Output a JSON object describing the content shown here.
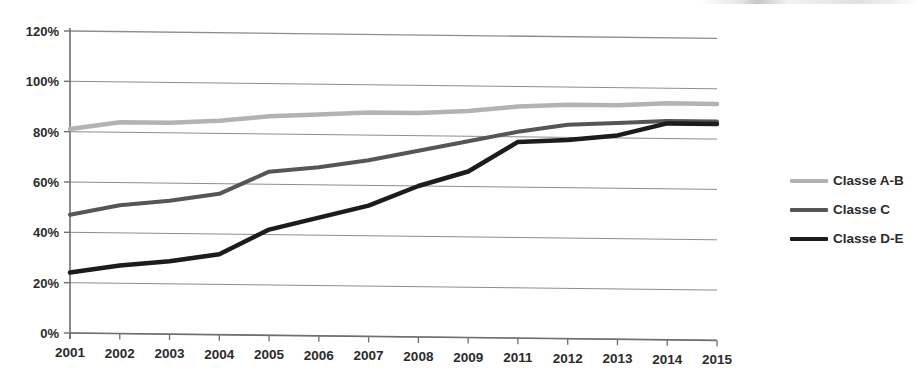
{
  "chart_data": {
    "type": "line",
    "title": "",
    "subtitle": "",
    "xlabel": "",
    "ylabel": "",
    "categories": [
      "2001",
      "2002",
      "2003",
      "2004",
      "2005",
      "2006",
      "2007",
      "2008",
      "2009",
      "2011",
      "2012",
      "2013",
      "2014",
      "2015"
    ],
    "ylim": [
      0,
      120
    ],
    "ytick_labels": [
      "0%",
      "20%",
      "40%",
      "60%",
      "80%",
      "100%",
      "120%"
    ],
    "ytick_values": [
      0,
      20,
      40,
      60,
      80,
      100,
      120
    ],
    "grid": true,
    "legend_position": "right",
    "series": [
      {
        "name": "Classe A-B",
        "color": "#b3b3b3",
        "width": 4.5,
        "values": [
          81,
          84,
          84,
          85,
          87,
          88,
          89,
          89,
          90,
          92,
          93,
          93,
          94,
          94
        ]
      },
      {
        "name": "Classe C",
        "color": "#565656",
        "width": 4.0,
        "values": [
          47,
          51,
          53,
          56,
          65,
          67,
          70,
          74,
          78,
          82,
          85,
          86,
          87,
          87
        ]
      },
      {
        "name": "Classe D-E",
        "color": "#1c1c1c",
        "width": 4.5,
        "values": [
          24,
          27,
          29,
          32,
          42,
          47,
          52,
          60,
          66,
          78,
          79,
          81,
          86,
          86
        ]
      }
    ]
  },
  "legend": {
    "items": [
      {
        "label": "Classe A-B",
        "color": "#b3b3b3"
      },
      {
        "label": "Classe C",
        "color": "#565656"
      },
      {
        "label": "Classe D-E",
        "color": "#1c1c1c"
      }
    ]
  },
  "axes": {
    "y_labels": [
      "120%",
      "100%",
      "80%",
      "60%",
      "40%",
      "20%",
      "0%"
    ],
    "x_labels": [
      "2001",
      "2002",
      "2003",
      "2004",
      "2005",
      "2006",
      "2007",
      "2008",
      "2009",
      "2011",
      "2012",
      "2013",
      "2014",
      "2015"
    ]
  }
}
